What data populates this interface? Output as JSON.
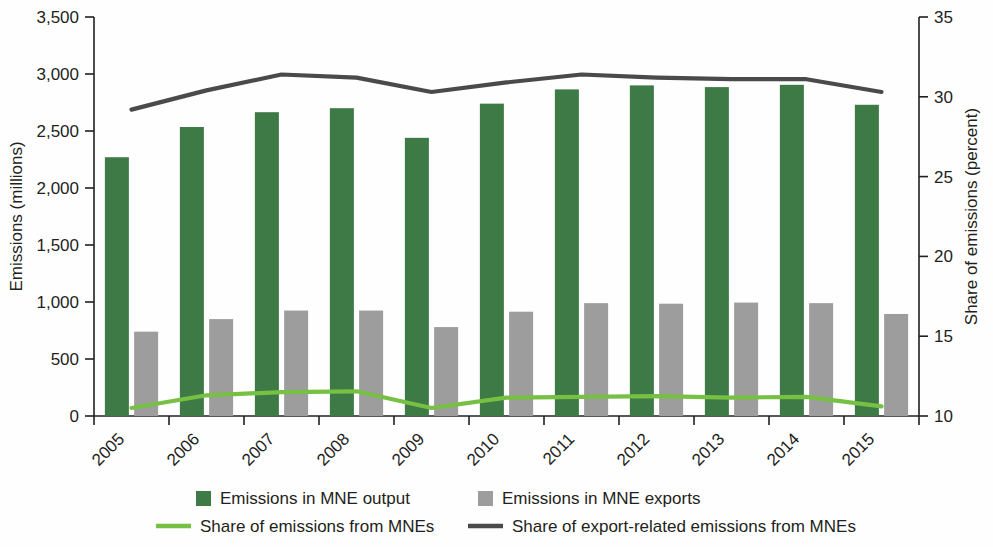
{
  "chart_data": {
    "type": "bar",
    "title": "",
    "subtitle": "",
    "xlabel": "",
    "ylabel": "Emissions (millions)",
    "y2label": "Share of emissions (percent)",
    "grid": false,
    "legend_position": "bottom",
    "categories": [
      "2005",
      "2006",
      "2007",
      "2008",
      "2009",
      "2010",
      "2011",
      "2012",
      "2013",
      "2014",
      "2015"
    ],
    "ylim": [
      0,
      3500
    ],
    "yticks": [
      0,
      500,
      1000,
      1500,
      2000,
      2500,
      3000,
      3500
    ],
    "ytick_labels": [
      "0",
      "500",
      "1,000",
      "1,500",
      "2,000",
      "2,500",
      "3,000",
      "3,500"
    ],
    "y2lim": [
      10,
      35
    ],
    "y2ticks": [
      10,
      15,
      20,
      25,
      30,
      35
    ],
    "y2tick_labels": [
      "10",
      "15",
      "20",
      "25",
      "30",
      "35"
    ],
    "series": [
      {
        "name": "Emissions in MNE output",
        "type": "bar",
        "axis": "left",
        "color": "#3d7a45",
        "values": [
          2270,
          2535,
          2665,
          2700,
          2440,
          2740,
          2865,
          2900,
          2885,
          2905,
          2730
        ]
      },
      {
        "name": "Emissions in MNE exports",
        "type": "bar",
        "axis": "left",
        "color": "#9d9d9d",
        "values": [
          740,
          850,
          925,
          925,
          780,
          915,
          990,
          985,
          995,
          990,
          895
        ]
      },
      {
        "name": "Share of emissions from MNEs",
        "type": "line",
        "axis": "right",
        "color": "#76c043",
        "values": [
          10.5,
          11.3,
          11.5,
          11.55,
          10.5,
          11.15,
          11.2,
          11.25,
          11.15,
          11.2,
          10.6
        ]
      },
      {
        "name": "Share of export-related emissions from MNEs",
        "type": "line",
        "axis": "right",
        "color": "#4a4a4a",
        "values": [
          29.2,
          30.4,
          31.4,
          31.2,
          30.3,
          30.9,
          31.4,
          31.2,
          31.1,
          31.1,
          30.3
        ]
      }
    ]
  },
  "legend": {
    "items": [
      {
        "label": "Emissions in MNE output",
        "marker": "square",
        "color": "#3d7a45"
      },
      {
        "label": "Emissions in MNE exports",
        "marker": "square",
        "color": "#9d9d9d"
      },
      {
        "label": "Share of emissions from MNEs",
        "marker": "line",
        "color": "#76c043"
      },
      {
        "label": "Share of export-related emissions from MNEs",
        "marker": "line",
        "color": "#4a4a4a"
      }
    ]
  }
}
